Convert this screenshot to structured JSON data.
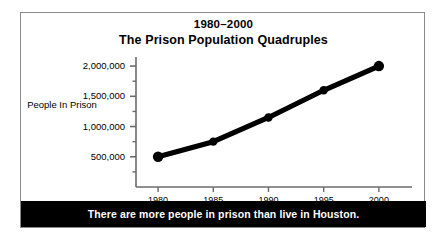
{
  "figure": {
    "title_line_1": "1980–2000",
    "title_line_2": "The Prison Population Quadruples",
    "caption": "There are more people in prison than live in Houston.",
    "colors": {
      "line": "#000000",
      "marker": "#000000",
      "axis": "#6b6b6b",
      "frame": "#8a8a8a",
      "caption_background": "#000000",
      "caption_text": "#ffffff",
      "background": "#ffffff"
    }
  },
  "chart_data": {
    "type": "line",
    "title": "The Prison Population Quadruples",
    "subtitle": "1980–2000",
    "xlabel": "",
    "ylabel": "People In Prison",
    "x": [
      1980,
      1985,
      1990,
      1995,
      2000
    ],
    "values": [
      500000,
      750000,
      1150000,
      1600000,
      2000000
    ],
    "categories": [
      "1980",
      "1985",
      "1990",
      "1995",
      "2000"
    ],
    "xtick_labels": [
      "1980",
      "1985",
      "1990",
      "1995",
      "2000"
    ],
    "ytick_labels": [
      "500,000",
      "1,000,000",
      "1,500,000",
      "2,000,000"
    ],
    "ytick_values": [
      500000,
      1000000,
      1500000,
      2000000
    ],
    "yminor_values": [
      250000,
      750000,
      1250000,
      1750000
    ],
    "xlim": [
      1978,
      2003
    ],
    "ylim": [
      0,
      2150000
    ],
    "grid": false,
    "legend": null,
    "marker": "circle",
    "annotations": [
      "There are more people in prison than live in Houston."
    ]
  }
}
